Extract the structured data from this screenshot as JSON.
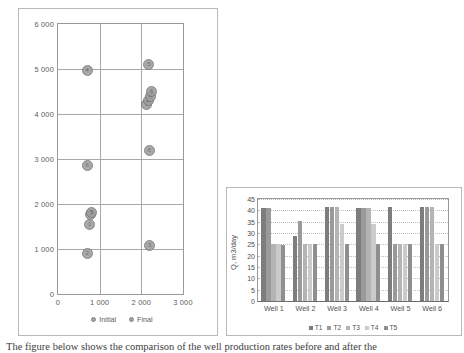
{
  "chart_data": [
    {
      "type": "scatter",
      "title": "",
      "xlabel": "",
      "ylabel": "",
      "xlim": [
        0,
        3000
      ],
      "ylim": [
        0,
        6000
      ],
      "xticks": [
        "0",
        "1 000",
        "2 000",
        "3 000"
      ],
      "xtick_values": [
        0,
        1000,
        2000,
        3000
      ],
      "yticks": [
        "0",
        "1 000",
        "2 000",
        "3 000",
        "4 000",
        "5 000",
        "6 000"
      ],
      "ytick_values": [
        0,
        1000,
        2000,
        3000,
        4000,
        5000,
        6000
      ],
      "grid": true,
      "legend_position": "bottom",
      "series": [
        {
          "name": "Initial",
          "marker_label_field": "well",
          "points": [
            {
              "well": "1",
              "x": 760,
              "y": 1550
            },
            {
              "well": "2",
              "x": 700,
              "y": 910
            },
            {
              "well": "3",
              "x": 790,
              "y": 1760
            },
            {
              "well": "4",
              "x": 700,
              "y": 4960
            },
            {
              "well": "5",
              "x": 810,
              "y": 1820
            },
            {
              "well": "6",
              "x": 700,
              "y": 2860
            }
          ]
        },
        {
          "name": "Final",
          "marker_label_field": "well",
          "points": [
            {
              "well": "1",
              "x": 2130,
              "y": 4210
            },
            {
              "well": "2",
              "x": 2160,
              "y": 4290
            },
            {
              "well": "3",
              "x": 2200,
              "y": 1080
            },
            {
              "well": "4",
              "x": 2210,
              "y": 4380
            },
            {
              "well": "5",
              "x": 2180,
              "y": 5100
            },
            {
              "well": "6",
              "x": 2250,
              "y": 4490
            },
            {
              "well": "6b",
              "x": 2190,
              "y": 3200
            }
          ]
        }
      ],
      "legend": [
        "Initial",
        "Final"
      ]
    },
    {
      "type": "bar",
      "title": "",
      "xlabel": "",
      "ylabel": "Q, m3/day",
      "ylim": [
        0,
        45
      ],
      "yticks": [
        "0",
        "5",
        "10",
        "15",
        "20",
        "25",
        "30",
        "35",
        "40",
        "45"
      ],
      "ytick_values": [
        0,
        5,
        10,
        15,
        20,
        25,
        30,
        35,
        40,
        45
      ],
      "grid": true,
      "legend_position": "bottom",
      "categories": [
        "Well 1",
        "Well 2",
        "Well 3",
        "Well 4",
        "Well 5",
        "Well 6"
      ],
      "series": [
        {
          "name": "T1",
          "values": [
            41,
            28.6,
            41.3,
            41.2,
            41.3,
            41.3
          ]
        },
        {
          "name": "T2",
          "values": [
            41,
            35.3,
            41.3,
            41.2,
            25,
            41.3
          ]
        },
        {
          "name": "T3",
          "values": [
            25,
            25,
            41.3,
            41.2,
            25,
            41.3
          ]
        },
        {
          "name": "T4",
          "values": [
            25,
            25,
            33.8,
            33.8,
            25,
            25
          ]
        },
        {
          "name": "T5",
          "values": [
            24.8,
            25,
            25,
            25,
            25,
            25
          ]
        }
      ],
      "legend": [
        "T1",
        "T2",
        "T3",
        "T4",
        "T5"
      ]
    }
  ],
  "scatter": {
    "yticks": [
      "6 000",
      "5 000",
      "4 000",
      "3 000",
      "2 000",
      "1 000",
      "0"
    ],
    "xticks": [
      "0",
      "1 000",
      "2 000",
      "3 000"
    ],
    "legend": [
      {
        "label": "Initial"
      },
      {
        "label": "Final"
      }
    ]
  },
  "bar": {
    "ylabel": "Q, m3/day",
    "yticks": [
      "45",
      "40",
      "35",
      "30",
      "25",
      "20",
      "15",
      "10",
      "5",
      "0"
    ],
    "categories": [
      "Well 1",
      "Well 2",
      "Well 3",
      "Well 4",
      "Well 5",
      "Well 6"
    ],
    "legend": [
      {
        "label": "T1",
        "color": "#7d7d7d"
      },
      {
        "label": "T2",
        "color": "#9a9a9a"
      },
      {
        "label": "T3",
        "color": "#b4b4b4"
      },
      {
        "label": "T4",
        "color": "#cbcbcb"
      },
      {
        "label": "T5",
        "color": "#8f8f8f"
      }
    ]
  },
  "caption": {
    "text": "The figure below shows the comparison of the well production rates before and after the"
  },
  "colors": {
    "marker_fill": "#9d9d9d",
    "marker_stroke": "#7b7b7b",
    "grid": "#a8a8a8",
    "axis": "#6d6d6d",
    "frame": "#b9b9b9"
  }
}
